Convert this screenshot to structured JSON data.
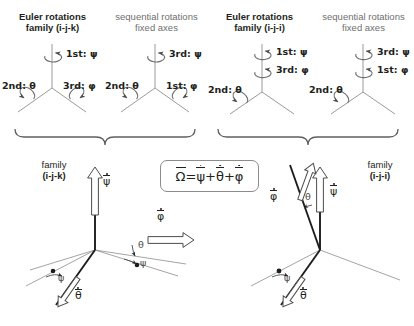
{
  "figure": {
    "background_color": "#ffffff",
    "ink_color": "#231f20",
    "grey_color": "#6f6f6f"
  },
  "headers": [
    {
      "line1": "Euler rotations",
      "line2": "family (i-j-k)",
      "style": "bold"
    },
    {
      "line1": "sequential rotations",
      "line2": "fixed axes",
      "style": "grey"
    },
    {
      "line1": "Euler rotations",
      "line2": "family (i-j-i)",
      "style": "bold"
    },
    {
      "line1": "sequential rotations",
      "line2": "fixed axes",
      "style": "grey"
    }
  ],
  "tripods": [
    {
      "id": "euler-ijk",
      "labels": {
        "vertical": "1st: ψ",
        "left": "2nd: θ",
        "right": "3rd: φ"
      }
    },
    {
      "id": "sequential-ijk",
      "labels": {
        "vertical": "3rd: ψ",
        "left": "2nd: θ",
        "right": "1st: φ"
      }
    },
    {
      "id": "euler-iji",
      "labels": {
        "vertical_top": "1st: ψ",
        "vertical_bottom": "3rd: φ",
        "left": "2nd: θ"
      }
    },
    {
      "id": "sequential-iji",
      "labels": {
        "vertical_top": "3rd: ψ",
        "vertical_bottom": "1st: φ",
        "left": "2nd: θ"
      }
    }
  ],
  "families": [
    {
      "id": "family-ijk",
      "line1": "family",
      "line2": "(i-j-k)"
    },
    {
      "id": "family-iji",
      "line1": "family",
      "line2": "(i-j-i)"
    }
  ],
  "formula": {
    "omega": "Ω",
    "equals": "=",
    "psi": "ψ",
    "plus1": "+",
    "theta": "θ",
    "plus2": "+",
    "phi": "φ"
  },
  "diagrams": [
    {
      "id": "angular-velocity-ijk",
      "vectors": [
        {
          "name": "psi-dot",
          "symbol": "ψ",
          "direction": "vertical-up"
        },
        {
          "name": "phi-dot",
          "symbol": "φ",
          "direction": "right-horizontal"
        },
        {
          "name": "theta-dot",
          "symbol": "θ",
          "direction": "lower-left"
        }
      ],
      "angles": [
        {
          "name": "theta-angle",
          "symbol": "θ"
        },
        {
          "name": "psi-angle-right",
          "symbol": "ψ"
        },
        {
          "name": "psi-angle-left",
          "symbol": "ψ"
        }
      ]
    },
    {
      "id": "angular-velocity-iji",
      "vectors": [
        {
          "name": "phi-dot",
          "symbol": "φ",
          "direction": "upper-left-tilted"
        },
        {
          "name": "psi-dot",
          "symbol": "ψ",
          "direction": "vertical-up"
        },
        {
          "name": "theta-dot",
          "symbol": "θ",
          "direction": "lower-left"
        }
      ],
      "angles": [
        {
          "name": "theta-angle",
          "symbol": "θ"
        },
        {
          "name": "psi-angle",
          "symbol": "ψ"
        }
      ]
    }
  ]
}
